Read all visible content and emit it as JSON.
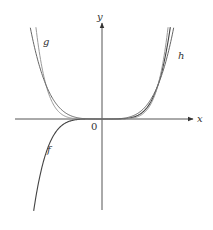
{
  "chart_data": {
    "type": "line",
    "title": "",
    "xlabel": "x",
    "ylabel": "y",
    "origin_label": "0",
    "grid": false,
    "legend": "none (curves labeled inline)",
    "xlim": [
      -1.55,
      1.6
    ],
    "ylim": [
      -2.68,
      2.68
    ],
    "series": [
      {
        "name": "f",
        "expression": "x^5",
        "color": "#444444",
        "width": 1.1,
        "domain": [
          -1.22,
          1.22
        ],
        "label_pos": [
          47,
          153
        ]
      },
      {
        "name": "g",
        "expression": "x^6",
        "color": "#9a9a9a",
        "width": 1.0,
        "domain": [
          -1.18,
          1.18
        ],
        "label_pos": [
          43,
          45
        ]
      },
      {
        "name": "h",
        "expression": "x^4",
        "color": "#666666",
        "width": 1.0,
        "domain": [
          -1.28,
          1.28
        ],
        "label_pos": [
          178,
          59
        ]
      }
    ]
  },
  "layout": {
    "origin_px": [
      102,
      119
    ],
    "scale_x": 56,
    "scale_y": 34,
    "x_axis": {
      "from": 15,
      "to": 193
    },
    "y_axis": {
      "from": 210,
      "to": 23
    },
    "axis_color": "#555555"
  },
  "labels": {
    "x_axis": "x",
    "y_axis": "y",
    "origin": "0",
    "f": "f",
    "g": "g",
    "h": "h"
  }
}
